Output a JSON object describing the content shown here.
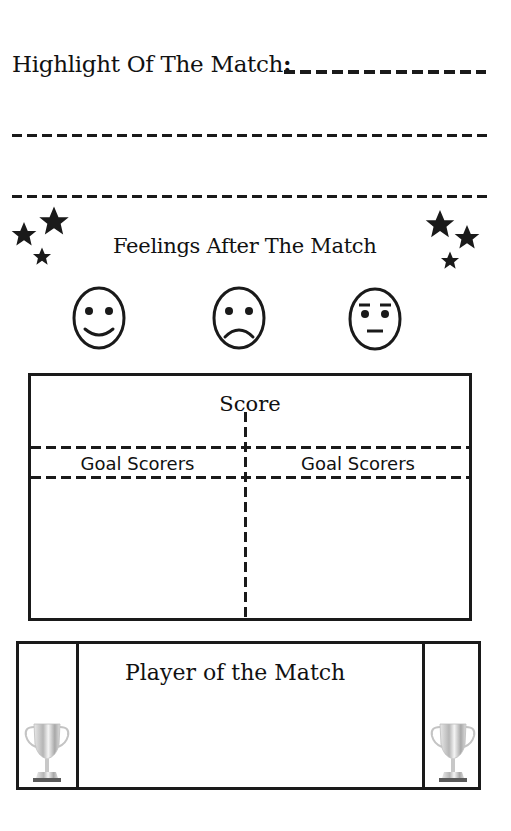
{
  "highlight": {
    "label": "Highlight Of The Match",
    "colon": ":",
    "blank_lines": 3
  },
  "feelings": {
    "title": "Feelings After The Match",
    "faces": [
      {
        "name": "happy-face-icon",
        "mood": "happy"
      },
      {
        "name": "sad-face-icon",
        "mood": "sad"
      },
      {
        "name": "neutral-face-icon",
        "mood": "neutral"
      }
    ],
    "decorations": [
      "star-cluster-left-icon",
      "star-cluster-right-icon"
    ]
  },
  "score_box": {
    "title": "Score",
    "columns": [
      {
        "header": "Goal Scorers"
      },
      {
        "header": "Goal Scorers"
      }
    ]
  },
  "player_of_match": {
    "title": "Player of the Match",
    "icons": [
      "trophy-icon",
      "trophy-icon"
    ]
  },
  "colors": {
    "ink": "#1a1a1a",
    "background": "#ffffff",
    "trophy_silver": "#c8c8c8"
  }
}
